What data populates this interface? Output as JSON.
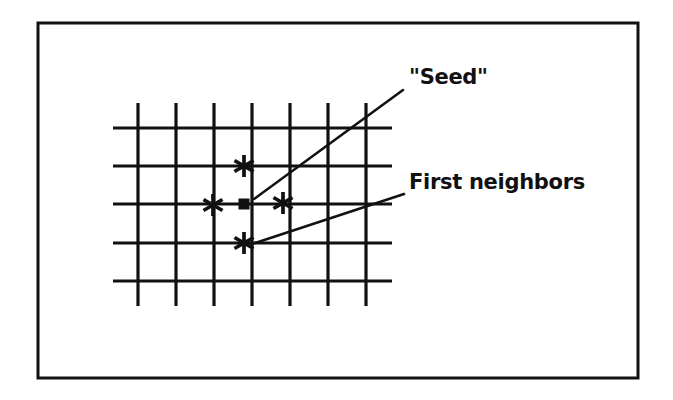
{
  "figure": {
    "kind": "lattice-diagram",
    "caption_alt": "Square lattice showing a seed site and its first neighbors",
    "background_color": "#ffffff",
    "ink_color": "#111111",
    "frame": {
      "name": "figure-border",
      "x": 38,
      "y": 23,
      "width": 600,
      "height": 355,
      "stroke_width": 3,
      "color": "#111111"
    },
    "lattice": {
      "name": "square-lattice",
      "vertical_line_x": [
        138,
        176,
        214,
        252,
        290,
        328,
        366
      ],
      "horizontal_line_y": [
        128,
        166,
        204,
        243,
        281
      ],
      "vertical_span_y": [
        103,
        306
      ],
      "horizontal_span_x": [
        113,
        392
      ],
      "stroke_width": 3.2,
      "spacing": 38,
      "color": "#111111"
    },
    "markers": [
      {
        "name": "seed-marker",
        "type": "filled-square",
        "x": 244,
        "y": 204,
        "size": 11,
        "color": "#111111",
        "role": "seed"
      },
      {
        "name": "neighbor-marker-north",
        "type": "asterisk",
        "glyph": "✳",
        "x": 244,
        "y": 166,
        "size": 22,
        "color": "#111111",
        "role": "first-neighbor"
      },
      {
        "name": "neighbor-marker-west",
        "type": "asterisk",
        "glyph": "✳",
        "x": 213,
        "y": 205,
        "size": 22,
        "color": "#111111",
        "role": "first-neighbor"
      },
      {
        "name": "neighbor-marker-east",
        "type": "asterisk",
        "glyph": "✳",
        "x": 283,
        "y": 203,
        "size": 22,
        "color": "#111111",
        "role": "first-neighbor"
      },
      {
        "name": "neighbor-marker-south",
        "type": "asterisk",
        "glyph": "✳",
        "x": 244,
        "y": 243,
        "size": 22,
        "color": "#111111",
        "role": "first-neighbor"
      }
    ],
    "annotations": [
      {
        "name": "seed-annotation",
        "label": "\"Seed\"",
        "text_x": 409,
        "text_y": 84,
        "font_size": 21,
        "leader": {
          "name": "seed-leader-line",
          "x1": 254,
          "y1": 199,
          "x2": 403,
          "y2": 90,
          "stroke_width": 2.6
        }
      },
      {
        "name": "first-neighbors-annotation",
        "label": "First neighbors",
        "text_x": 409,
        "text_y": 189,
        "font_size": 21,
        "leader": {
          "name": "first-neighbors-leader-line",
          "x1": 252,
          "y1": 244,
          "x2": 404,
          "y2": 194,
          "stroke_width": 2.6
        }
      }
    ]
  }
}
